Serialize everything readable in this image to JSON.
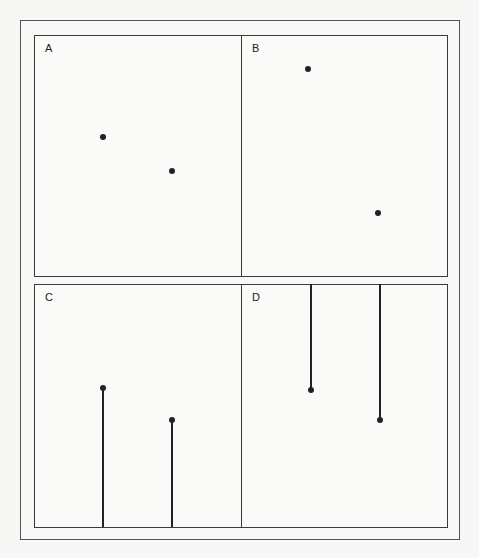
{
  "figure": {
    "panels": [
      {
        "id": "A",
        "label": "A",
        "type": "dots",
        "points": [
          {
            "x": 103,
            "y": 137
          },
          {
            "x": 172,
            "y": 171
          }
        ]
      },
      {
        "id": "B",
        "label": "B",
        "type": "dots",
        "points": [
          {
            "x": 308,
            "y": 69
          },
          {
            "x": 378,
            "y": 213
          }
        ]
      },
      {
        "id": "C",
        "label": "C",
        "type": "stems-from-bottom",
        "points": [
          {
            "x": 103,
            "y": 388
          },
          {
            "x": 172,
            "y": 420
          }
        ]
      },
      {
        "id": "D",
        "label": "D",
        "type": "stems-from-top",
        "points": [
          {
            "x": 311,
            "y": 390
          },
          {
            "x": 380,
            "y": 420
          }
        ]
      }
    ],
    "colors": {
      "ink": "#222222",
      "frame": "#555555",
      "background": "#f7f7f5"
    }
  }
}
